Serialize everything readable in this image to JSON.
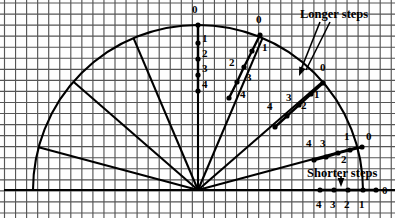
{
  "figure": {
    "background_color": "#fefefe",
    "grid_color": "#555555",
    "ink_color": "#000000",
    "width": 395,
    "height": 218
  },
  "annotations": [
    {
      "name": "longer-steps",
      "text": "Longer steps",
      "x": 300,
      "y": 8
    },
    {
      "name": "shorter-steps",
      "text": "Shorter steps",
      "x": 307,
      "y": 167
    }
  ],
  "chart_data": {
    "type": "scatter",
    "xlabel": "",
    "ylabel": "",
    "grid": true,
    "legend": null,
    "origin": {
      "x": 198,
      "y": 190
    },
    "arc_radius": 165,
    "tick_values": [
      0,
      1,
      2,
      3,
      4
    ],
    "series": [
      {
        "name": "vertical-ray",
        "angle_deg": 90,
        "step_kind": "longer",
        "labels": [
          "0",
          "1",
          "2",
          "3",
          "4"
        ],
        "points": [
          {
            "label": "0",
            "x": 198,
            "y": 25,
            "lx": 192,
            "ly": 4
          },
          {
            "label": "1",
            "x": 198,
            "y": 43,
            "lx": 202,
            "ly": 33
          },
          {
            "label": "2",
            "x": 198,
            "y": 59,
            "lx": 202,
            "ly": 48
          },
          {
            "label": "3",
            "x": 198,
            "y": 75,
            "lx": 202,
            "ly": 63
          },
          {
            "label": "4",
            "x": 198,
            "y": 91,
            "lx": 202,
            "ly": 79
          }
        ]
      },
      {
        "name": "ray-upper-right",
        "angle_deg": 67,
        "step_kind": "longer",
        "labels": [
          "0",
          "1",
          "2",
          "3",
          "4"
        ],
        "points": [
          {
            "label": "0",
            "x": 260,
            "y": 35,
            "lx": 256,
            "ly": 14
          },
          {
            "label": "1",
            "x": 252,
            "y": 51,
            "lx": 262,
            "ly": 42
          },
          {
            "label": "2",
            "x": 244,
            "y": 67,
            "lx": 229,
            "ly": 57
          },
          {
            "label": "3",
            "x": 237,
            "y": 82,
            "lx": 246,
            "ly": 72
          },
          {
            "label": "4",
            "x": 229,
            "y": 98,
            "lx": 240,
            "ly": 89
          }
        ]
      },
      {
        "name": "ray-mid-right",
        "angle_deg": 41,
        "step_kind": "longer",
        "labels": [
          "0",
          "1",
          "2",
          "3",
          "4"
        ],
        "points": [
          {
            "label": "0",
            "x": 323,
            "y": 83,
            "lx": 320,
            "ly": 62
          },
          {
            "label": "1",
            "x": 311,
            "y": 94,
            "lx": 314,
            "ly": 89
          },
          {
            "label": "2",
            "x": 299,
            "y": 105,
            "lx": 301,
            "ly": 100
          },
          {
            "label": "3",
            "x": 287,
            "y": 116,
            "lx": 286,
            "ly": 92
          },
          {
            "label": "4",
            "x": 275,
            "y": 127,
            "lx": 267,
            "ly": 101
          }
        ]
      },
      {
        "name": "ray-lower-right",
        "angle_deg": 15,
        "step_kind": "shorter",
        "labels": [
          "0",
          "1",
          "2",
          "3",
          "4"
        ],
        "points": [
          {
            "label": "0",
            "x": 362,
            "y": 147,
            "lx": 366,
            "ly": 131
          },
          {
            "label": "1",
            "x": 350,
            "y": 150,
            "lx": 344,
            "ly": 131
          },
          {
            "label": "2",
            "x": 338,
            "y": 153,
            "lx": 341,
            "ly": 154
          },
          {
            "label": "3",
            "x": 326,
            "y": 157,
            "lx": 320,
            "ly": 138
          },
          {
            "label": "4",
            "x": 314,
            "y": 160,
            "lx": 306,
            "ly": 138
          }
        ]
      },
      {
        "name": "horizontal-baseline-ray",
        "angle_deg": 0,
        "step_kind": "shorter",
        "labels": [
          "0",
          "1",
          "2",
          "3",
          "4"
        ],
        "points": [
          {
            "label": "0",
            "x": 376,
            "y": 190,
            "lx": 382,
            "ly": 185
          },
          {
            "label": "1",
            "x": 363,
            "y": 190,
            "lx": 359,
            "ly": 199
          },
          {
            "label": "2",
            "x": 348,
            "y": 190,
            "lx": 344,
            "ly": 199
          },
          {
            "label": "3",
            "x": 334,
            "y": 190,
            "lx": 330,
            "ly": 199
          },
          {
            "label": "4",
            "x": 320,
            "y": 190,
            "lx": 316,
            "ly": 199
          }
        ]
      }
    ],
    "unlabeled_rays": [
      {
        "name": "ray-left-1",
        "angle_deg": 113
      },
      {
        "name": "ray-left-2",
        "angle_deg": 139
      },
      {
        "name": "ray-left-3",
        "angle_deg": 165
      },
      {
        "name": "ray-left-4",
        "angle_deg": 180
      }
    ]
  }
}
